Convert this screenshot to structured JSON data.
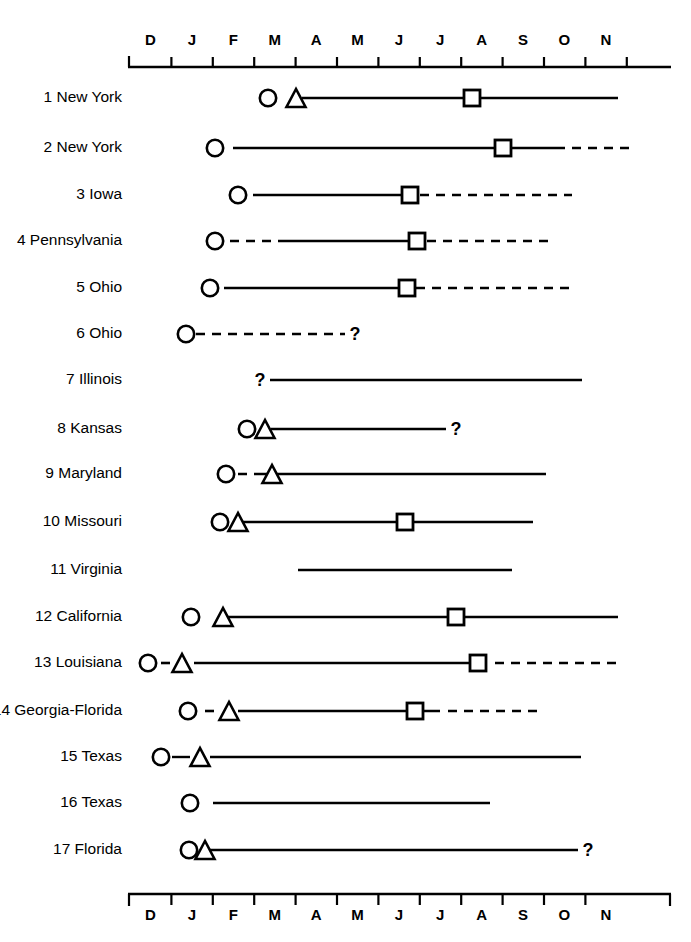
{
  "chart_data": {
    "type": "table",
    "title": "",
    "xlabel": "",
    "ylabel": "",
    "grid": false,
    "legend": "none",
    "axis": {
      "tick_labels": [
        "D",
        "J",
        "F",
        "M",
        "A",
        "M",
        "J",
        "J",
        "A",
        "S",
        "O",
        "N"
      ],
      "tick_count": 12,
      "x_start_px": 130,
      "x_end_px": 668,
      "month_width_px": 41.4,
      "note": "Top and bottom month axes; labels are month initials December through November"
    },
    "marker_legend": [
      {
        "symbol": "circle",
        "name": "circle-marker"
      },
      {
        "symbol": "triangle",
        "name": "triangle-marker"
      },
      {
        "symbol": "square",
        "name": "square-marker"
      },
      {
        "symbol": "question",
        "name": "question-mark"
      }
    ],
    "categories": [
      "1 New York",
      "2 New York",
      "3 Iowa",
      "4 Pennsylvania",
      "5 Ohio",
      "6 Ohio",
      "7 Illinois",
      "8 Kansas",
      "9 Maryland",
      "10 Missouri",
      "11 Virginia",
      "12 California",
      "13 Louisiana",
      "14 Georgia-Florida",
      "15 Texas",
      "16 Texas",
      "17 Florida"
    ],
    "rows": [
      {
        "id": 1,
        "label": "1 New York",
        "y": 98,
        "segments": [
          {
            "style": "solid",
            "x1": 302,
            "x2": 618
          }
        ],
        "markers": [
          {
            "type": "circle",
            "x": 268
          },
          {
            "type": "triangle",
            "x": 296
          },
          {
            "type": "square",
            "x": 472
          }
        ]
      },
      {
        "id": 2,
        "label": "2 New York",
        "y": 148,
        "segments": [
          {
            "style": "solid",
            "x1": 233,
            "x2": 556
          },
          {
            "style": "dashed",
            "x1": 556,
            "x2": 629
          }
        ],
        "markers": [
          {
            "type": "circle",
            "x": 215
          },
          {
            "type": "square",
            "x": 503
          }
        ]
      },
      {
        "id": 3,
        "label": "3 Iowa",
        "y": 195,
        "segments": [
          {
            "style": "solid",
            "x1": 253,
            "x2": 412
          },
          {
            "style": "dashed",
            "x1": 420,
            "x2": 572
          }
        ],
        "markers": [
          {
            "type": "circle",
            "x": 238
          },
          {
            "type": "square",
            "x": 410
          }
        ]
      },
      {
        "id": 4,
        "label": "4 Pennsylvania",
        "y": 241,
        "segments": [
          {
            "style": "dashed",
            "x1": 230,
            "x2": 283
          },
          {
            "style": "solid",
            "x1": 283,
            "x2": 419
          },
          {
            "style": "dashed",
            "x1": 427,
            "x2": 553
          }
        ],
        "markers": [
          {
            "type": "circle",
            "x": 215
          },
          {
            "type": "square",
            "x": 417
          }
        ]
      },
      {
        "id": 5,
        "label": "5 Ohio",
        "y": 288,
        "segments": [
          {
            "style": "solid",
            "x1": 224,
            "x2": 408
          },
          {
            "style": "dashed",
            "x1": 416,
            "x2": 572
          }
        ],
        "markers": [
          {
            "type": "circle",
            "x": 210
          },
          {
            "type": "square",
            "x": 407
          }
        ]
      },
      {
        "id": 6,
        "label": "6 Ohio",
        "y": 334,
        "segments": [
          {
            "style": "dashed",
            "x1": 196,
            "x2": 345
          }
        ],
        "markers": [
          {
            "type": "circle",
            "x": 186
          },
          {
            "type": "question",
            "x": 355
          }
        ]
      },
      {
        "id": 7,
        "label": "7 Illinois",
        "y": 380,
        "segments": [
          {
            "style": "solid",
            "x1": 270,
            "x2": 582
          }
        ],
        "markers": [
          {
            "type": "question",
            "x": 260
          }
        ]
      },
      {
        "id": 8,
        "label": "8 Kansas",
        "y": 429,
        "segments": [
          {
            "style": "solid",
            "x1": 271,
            "x2": 446
          }
        ],
        "markers": [
          {
            "type": "circle",
            "x": 247
          },
          {
            "type": "triangle",
            "x": 265
          },
          {
            "type": "question",
            "x": 456
          }
        ]
      },
      {
        "id": 9,
        "label": "9 Maryland",
        "y": 474,
        "segments": [
          {
            "style": "dashed",
            "x1": 238,
            "x2": 258
          },
          {
            "style": "solid",
            "x1": 258,
            "x2": 546
          }
        ],
        "markers": [
          {
            "type": "circle",
            "x": 226
          },
          {
            "type": "triangle",
            "x": 272
          }
        ]
      },
      {
        "id": 10,
        "label": "10 Missouri",
        "y": 522,
        "segments": [
          {
            "style": "solid",
            "x1": 242,
            "x2": 533
          }
        ],
        "markers": [
          {
            "type": "circle",
            "x": 220
          },
          {
            "type": "triangle",
            "x": 238
          },
          {
            "type": "square",
            "x": 405
          }
        ]
      },
      {
        "id": 11,
        "label": "11 Virginia",
        "y": 570,
        "segments": [
          {
            "style": "solid",
            "x1": 298,
            "x2": 512
          }
        ],
        "markers": []
      },
      {
        "id": 12,
        "label": "12 California",
        "y": 617,
        "segments": [
          {
            "style": "solid",
            "x1": 228,
            "x2": 618
          }
        ],
        "markers": [
          {
            "type": "circle",
            "x": 191
          },
          {
            "type": "triangle",
            "x": 223
          },
          {
            "type": "square",
            "x": 456
          }
        ]
      },
      {
        "id": 13,
        "label": "13 Louisiana",
        "y": 663,
        "segments": [
          {
            "style": "dashed",
            "x1": 161,
            "x2": 172
          },
          {
            "style": "solid",
            "x1": 194,
            "x2": 487
          },
          {
            "style": "dashed",
            "x1": 495,
            "x2": 620
          }
        ],
        "markers": [
          {
            "type": "circle",
            "x": 148
          },
          {
            "type": "triangle",
            "x": 182
          },
          {
            "type": "square",
            "x": 478
          }
        ]
      },
      {
        "id": 14,
        "label": "14 Georgia-Florida",
        "y": 711,
        "segments": [
          {
            "style": "dashed",
            "x1": 205,
            "x2": 218
          },
          {
            "style": "solid",
            "x1": 238,
            "x2": 440
          },
          {
            "style": "dashed",
            "x1": 448,
            "x2": 544
          }
        ],
        "markers": [
          {
            "type": "circle",
            "x": 188
          },
          {
            "type": "triangle",
            "x": 229
          },
          {
            "type": "square",
            "x": 415
          }
        ]
      },
      {
        "id": 15,
        "label": "15 Texas",
        "y": 757,
        "segments": [
          {
            "style": "solid",
            "x1": 172,
            "x2": 190
          },
          {
            "style": "solid",
            "x1": 210,
            "x2": 581
          }
        ],
        "markers": [
          {
            "type": "circle",
            "x": 161
          },
          {
            "type": "triangle",
            "x": 200
          }
        ]
      },
      {
        "id": 16,
        "label": "16 Texas",
        "y": 803,
        "segments": [
          {
            "style": "solid",
            "x1": 213,
            "x2": 490
          }
        ],
        "markers": [
          {
            "type": "circle",
            "x": 190
          }
        ]
      },
      {
        "id": 17,
        "label": "17 Florida",
        "y": 850,
        "segments": [
          {
            "style": "solid",
            "x1": 203,
            "x2": 578
          }
        ],
        "markers": [
          {
            "type": "circle",
            "x": 189
          },
          {
            "type": "triangle",
            "x": 205
          },
          {
            "type": "question",
            "x": 588
          }
        ]
      }
    ]
  },
  "axis_top": {
    "labels": [
      "D",
      "J",
      "F",
      "M",
      "A",
      "M",
      "J",
      "J",
      "A",
      "S",
      "O",
      "N"
    ]
  },
  "axis_bottom": {
    "labels": [
      "D",
      "J",
      "F",
      "M",
      "A",
      "M",
      "J",
      "J",
      "A",
      "S",
      "O",
      "N"
    ]
  }
}
